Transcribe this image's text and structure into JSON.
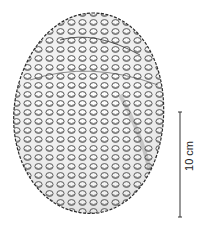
{
  "figure": {
    "style": "pen and ink stipple drawing",
    "colors": {
      "ink": "#2a2a2a",
      "background": "#ffffff",
      "shade": "#9a9a9a"
    }
  },
  "scale_bar": {
    "label": "10 cm",
    "orientation": "vertical"
  }
}
